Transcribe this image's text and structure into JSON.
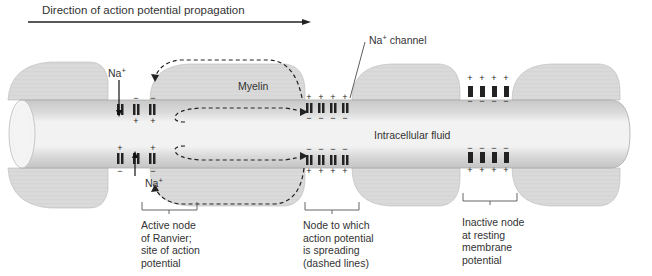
{
  "figure": {
    "direction_label": "Direction of action potential propagation",
    "myelin_label": "Myelin",
    "intracellular_label": "Intracellular fluid",
    "channel_label": {
      "ion": "Na",
      "charge": "+",
      "suffix": " channel"
    },
    "ion_labels": [
      {
        "ion": "Na",
        "charge": "+",
        "position": "top-active-node"
      },
      {
        "ion": "Na",
        "charge": "+",
        "position": "bottom-active-node"
      }
    ],
    "nodes": [
      {
        "id": "active",
        "caption": "Active node\nof Ranvier;\nsite of action\npotential",
        "outer_top_charges": [
          "−",
          "−"
        ],
        "inner_top_charges": [
          "+",
          "+"
        ],
        "inner_bottom_charges": [
          "+",
          "+"
        ],
        "outer_bottom_charges": [
          "−",
          "−"
        ]
      },
      {
        "id": "spreading",
        "caption": "Node to which\naction potential\nis spreading\n(dashed lines)",
        "outer_top_charges": [
          "+",
          "+",
          "+",
          "+"
        ],
        "inner_top_charges": [
          "−",
          "−",
          "−",
          "−"
        ],
        "inner_bottom_charges": [
          "−",
          "−",
          "−",
          "−"
        ],
        "outer_bottom_charges": [
          "+",
          "+",
          "+",
          "+"
        ]
      },
      {
        "id": "inactive",
        "caption": "Inactive node\nat resting\nmembrane\npotential",
        "outer_top_charges": [
          "+",
          "+",
          "+",
          "+"
        ],
        "inner_top_charges": [
          "−",
          "−",
          "−",
          "−"
        ],
        "inner_bottom_charges": [
          "−",
          "−",
          "−",
          "−"
        ],
        "outer_bottom_charges": [
          "+",
          "+",
          "+",
          "+"
        ]
      }
    ],
    "colors": {
      "axon_fill": "#e4e4e4",
      "axon_core": "#f0f0f0",
      "membrane": "#b5b5b5",
      "myelin": "#d2d2d2",
      "myelin_lines": "#ececec",
      "channel": "#222222",
      "text": "#333333"
    }
  }
}
